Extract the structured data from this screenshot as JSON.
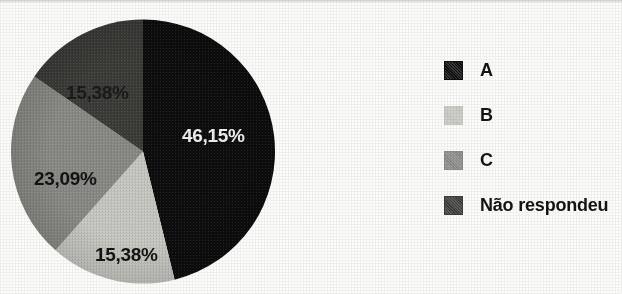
{
  "chart_data": {
    "type": "pie",
    "title": "",
    "subtitle": "",
    "xlabel": "",
    "ylabel": "",
    "grid": false,
    "legend_position": "right",
    "start_angle_deg": 0,
    "direction": "clockwise",
    "categories": [
      "A",
      "B",
      "C",
      "Não respondeu"
    ],
    "values": [
      46.15,
      15.38,
      23.09,
      15.38
    ],
    "value_labels": [
      "46,15%",
      "15,38%",
      "23,09%",
      "15,38%"
    ],
    "colors": [
      "#0d0d0d",
      "#c9c9c4",
      "#8b8b86",
      "#3c3c39"
    ],
    "slices": [
      {
        "name": "A",
        "label": "46,15%",
        "value": 46.15,
        "color": "#0d0d0d",
        "label_color": "#f2f2f0"
      },
      {
        "name": "B",
        "label": "15,38%",
        "value": 15.38,
        "color": "#c9c9c4",
        "label_color": "#131313"
      },
      {
        "name": "C",
        "label": "23,09%",
        "value": 23.09,
        "color": "#8b8b86",
        "label_color": "#131313"
      },
      {
        "name": "Não respondeu",
        "label": "15,38%",
        "value": 15.38,
        "color": "#3c3c39",
        "label_color": "#1b1b1b"
      }
    ]
  },
  "legend": {
    "items": [
      {
        "label": "A",
        "color": "#0d0d0d"
      },
      {
        "label": "B",
        "color": "#c9c9c4"
      },
      {
        "label": "C",
        "color": "#8b8b86"
      },
      {
        "label": "Não respondeu",
        "color": "#3c3c39"
      }
    ]
  }
}
